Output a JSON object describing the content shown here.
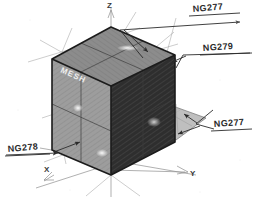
{
  "diagram": {
    "background_color": "#ffffff",
    "ink_color": "#1b1b1b"
  },
  "axes": [
    {
      "id": "z",
      "label": "Z",
      "direction": "up"
    },
    {
      "id": "y",
      "label": "Y",
      "direction": "lower-right"
    },
    {
      "id": "x",
      "label": "X",
      "direction": "lower-left"
    }
  ],
  "cube": {
    "face_label": "MESH",
    "top_face_color": "#8c8c8c",
    "left_face_color": "#9d9d9d",
    "right_face_color": "#2e2e2e"
  },
  "callouts": [
    {
      "id": "callout-top-right",
      "label": "NG277"
    },
    {
      "id": "callout-mid-right",
      "label": "NG279"
    },
    {
      "id": "callout-lower-right",
      "label": "NG277"
    },
    {
      "id": "callout-lower-left",
      "label": "NG278"
    }
  ]
}
